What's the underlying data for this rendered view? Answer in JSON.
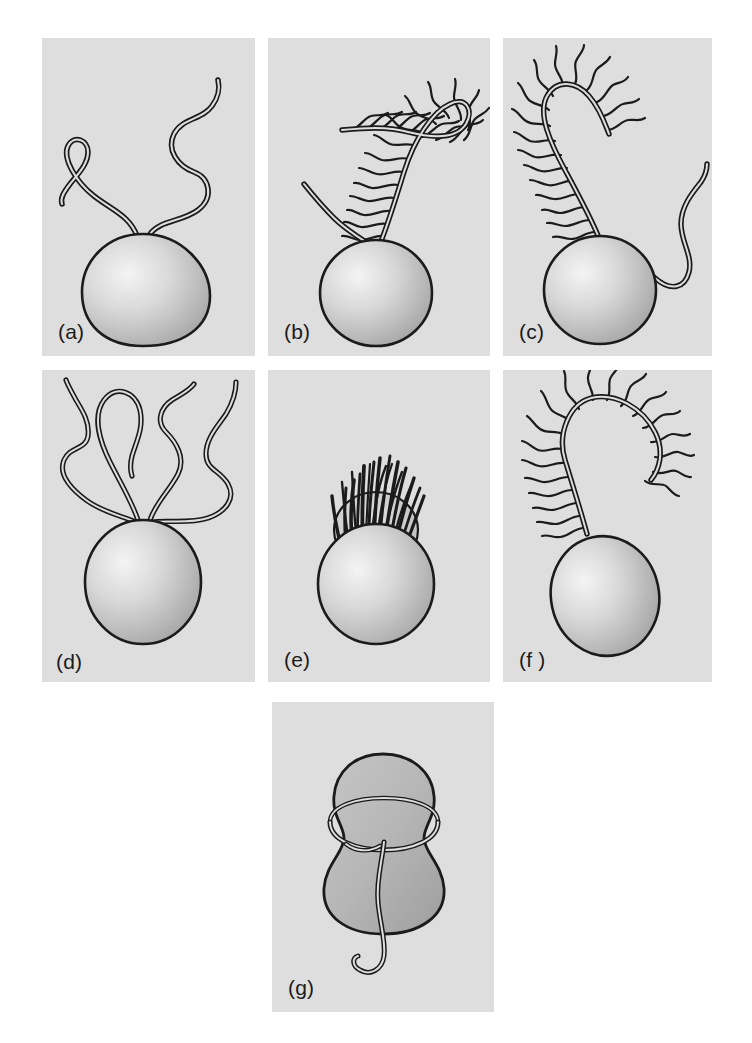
{
  "figure": {
    "background_color": "#ffffff",
    "panel_background_color": "#dedede",
    "ink_color": "#1b1b1b",
    "cell_body_fill_light": "#f0f0f0",
    "cell_body_fill_dark": "#a8a8a8",
    "layout": "3 columns x 2 rows, plus one centered panel in a third row",
    "panel_count": 7
  },
  "panels": [
    {
      "id": "a",
      "label": "(a)",
      "description": "Ovoid cell with two long smooth (whiplash) flagella emerging from the anterior pole, both directed forward and undulating",
      "flagella_count": 2,
      "flagellum_type": "smooth / whiplash",
      "insertion": "apical",
      "cell_shape": "ovoid-pyriform"
    },
    {
      "id": "b",
      "label": "(b)",
      "description": "Ovoid cell with one long tinsel flagellum bearing mastigonemes curving up and over, and one shorter smooth flagellum directed up-left",
      "flagella_count": 2,
      "flagellum_type": "heterokont: one tinsel (pleuronematic) + one smooth (whiplash)",
      "insertion": "apical",
      "cell_shape": "ovoid"
    },
    {
      "id": "c",
      "label": "(c)",
      "description": "Ovoid cell with an anteriorly directed tinsel flagellum bearing mastigonemes and a trailing smooth flagellum sweeping down to the right",
      "flagella_count": 2,
      "flagellum_type": "heterokont: one tinsel (pleuronematic) + one trailing smooth (whiplash)",
      "insertion": "subapical / lateral",
      "cell_shape": "ovoid"
    },
    {
      "id": "d",
      "label": "(d)",
      "description": "Ovoid cell with four long smooth flagella arising together from the apical pole and spreading outward",
      "flagella_count": 4,
      "flagellum_type": "smooth / whiplash",
      "insertion": "apical tuft",
      "cell_shape": "ovoid"
    },
    {
      "id": "e",
      "label": "(e)",
      "description": "Ovoid cell with a dense crown-like tuft of many short flagella inserted in an apical collar or girdle",
      "flagella_count": 20,
      "flagellum_type": "numerous short smooth flagella forming a tuft",
      "insertion": "apical crown / collar",
      "cell_shape": "ovoid"
    },
    {
      "id": "f",
      "label": "(f )",
      "description": "Ovoid cell with a single long tinsel flagellum bearing mastigonemes along its length, looping up and over to the right",
      "flagella_count": 1,
      "flagellum_type": "tinsel (pleuronematic)",
      "insertion": "apical",
      "cell_shape": "ovoid"
    },
    {
      "id": "g",
      "label": "(g)",
      "description": "Dinoflagellate-type biflagellate cell with a transverse flagellum encircling the cell in an equatorial girdle and a longitudinal flagellum trailing posteriorly",
      "flagella_count": 2,
      "flagellum_type": "transverse (girdle) + longitudinal (trailing)",
      "insertion": "ventral, at the girdle",
      "cell_shape": "bilobed peanut / epicone-hypocone"
    }
  ]
}
